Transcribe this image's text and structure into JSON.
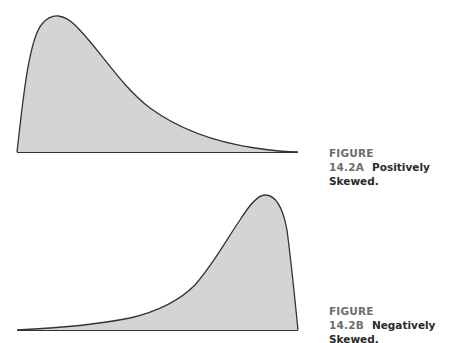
{
  "figures": [
    {
      "id": "A",
      "number_label": "FIGURE 14.2A",
      "title_label": "Positively Skewed.",
      "skew": "positive",
      "fill_color": "#d4d4d4",
      "stroke_color": "#333333"
    },
    {
      "id": "B",
      "number_label": "FIGURE 14.2B",
      "title_label": "Negatively Skewed.",
      "skew": "negative",
      "fill_color": "#d4d4d4",
      "stroke_color": "#333333"
    }
  ]
}
